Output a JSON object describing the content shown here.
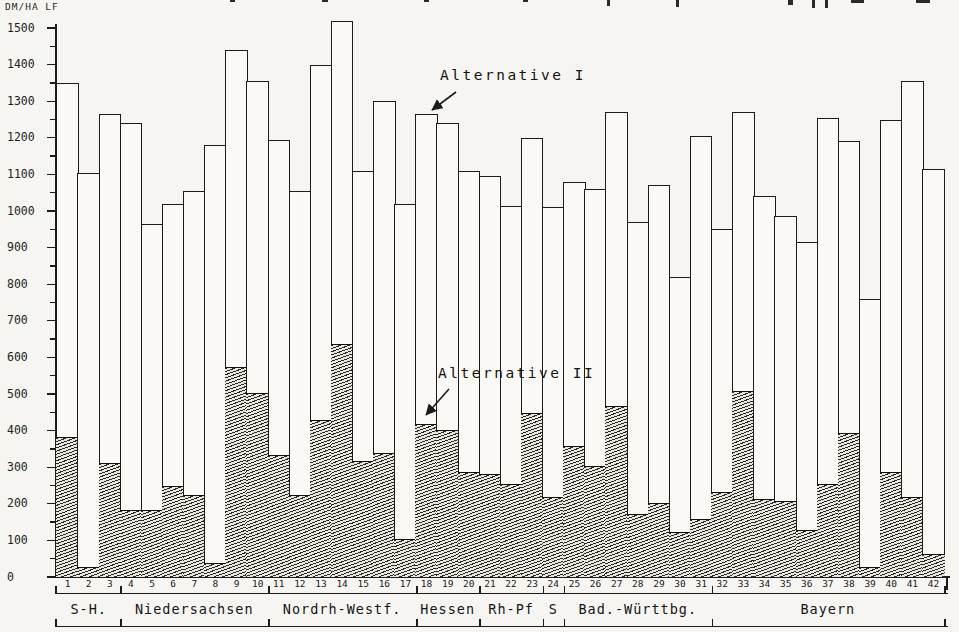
{
  "page": {
    "unit_label": "DM/HA LF"
  },
  "colors": {
    "ink": "#1c1c1a",
    "paper": "#f6f5f1",
    "bar_fill": "#faf9f5"
  },
  "chart_data": {
    "type": "bar",
    "subtype": "grouped-stacked-overlay",
    "title": "",
    "ylabel": "DM/HA LF",
    "ylim": [
      0,
      1500
    ],
    "ytick_step": 100,
    "ytick_minor_step": 50,
    "ytick_labels": [
      "0",
      "100",
      "200",
      "300",
      "400",
      "500",
      "600",
      "700",
      "800",
      "900",
      "1000",
      "1100",
      "1200",
      "1300",
      "1400",
      "1500"
    ],
    "x_labels": [
      "1",
      "2",
      "3",
      "4",
      "5",
      "6",
      "7",
      "8",
      "9",
      "10",
      "11",
      "12",
      "13",
      "14",
      "15",
      "16",
      "17",
      "18",
      "19",
      "20",
      "21",
      "22",
      "23",
      "24",
      "25",
      "26",
      "27",
      "28",
      "29",
      "30",
      "31",
      "32",
      "33",
      "34",
      "35",
      "36",
      "37",
      "38",
      "39",
      "40",
      "41",
      "42"
    ],
    "series": [
      {
        "name": "Alternative I",
        "style": "outline-white",
        "values": [
          1350,
          1105,
          1265,
          1240,
          965,
          1020,
          1055,
          1180,
          1440,
          1355,
          1195,
          1055,
          1400,
          1520,
          1110,
          1300,
          1020,
          1265,
          1240,
          1110,
          1095,
          1015,
          1200,
          1010,
          1080,
          1060,
          1270,
          970,
          1070,
          820,
          1205,
          950,
          1270,
          1040,
          985,
          915,
          1255,
          1190,
          760,
          1250,
          1355,
          1115
        ]
      },
      {
        "name": "Alternative II",
        "style": "hatched",
        "values": [
          380,
          25,
          310,
          180,
          180,
          245,
          220,
          35,
          570,
          500,
          330,
          220,
          425,
          635,
          315,
          335,
          100,
          415,
          400,
          285,
          280,
          250,
          445,
          215,
          355,
          300,
          465,
          170,
          200,
          120,
          155,
          230,
          505,
          210,
          205,
          125,
          250,
          390,
          25,
          285,
          215,
          60
        ]
      }
    ],
    "regions": [
      {
        "label": "S-H.",
        "from": 1,
        "to": 3
      },
      {
        "label": "Niedersachsen",
        "from": 4,
        "to": 10
      },
      {
        "label": "Nordrh-Westf.",
        "from": 11,
        "to": 17
      },
      {
        "label": "Hessen",
        "from": 18,
        "to": 20
      },
      {
        "label": "Rh-Pf",
        "from": 21,
        "to": 23
      },
      {
        "label": "S",
        "from": 24,
        "to": 24
      },
      {
        "label": "Bad.-Württbg.",
        "from": 25,
        "to": 31
      },
      {
        "label": "Bayern",
        "from": 32,
        "to": 42
      }
    ],
    "annotations": [
      {
        "text": "Alternative I",
        "points_to_bar": 18,
        "points_to": "top of outline bar"
      },
      {
        "text": "Alternative II",
        "points_to_bar": 18,
        "points_to": "top of hatched segment"
      }
    ],
    "legend_position": "none",
    "grid": false
  }
}
